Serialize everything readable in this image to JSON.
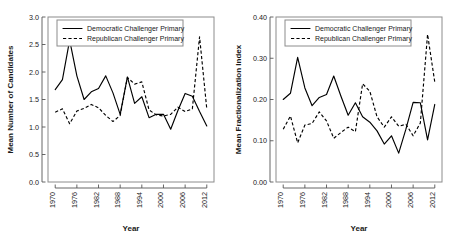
{
  "figure": {
    "panel_count": 2,
    "background": "#ffffff",
    "line_color": "#000000"
  },
  "chart_data": [
    {
      "type": "line",
      "panel": "left",
      "title": "",
      "xlabel": "Year",
      "ylabel": "Mean Number of Candidates",
      "xlim": [
        1968,
        2014
      ],
      "ylim": [
        0.0,
        3.0
      ],
      "xticks": [
        1970,
        1976,
        1982,
        1988,
        1994,
        2000,
        2006,
        2012
      ],
      "xticklabels": [
        "1970",
        "1976",
        "1982",
        "1988",
        "1994",
        "2000",
        "2006",
        "2012"
      ],
      "yticks": [
        0.0,
        0.5,
        1.0,
        1.5,
        2.0,
        2.5,
        3.0
      ],
      "yticklabels": [
        "0.0",
        "0.5",
        "1.0",
        "1.5",
        "2.0",
        "2.5",
        "3.0"
      ],
      "grid": false,
      "legend_position": "top-center",
      "x": [
        1970,
        1972,
        1974,
        1976,
        1978,
        1980,
        1982,
        1984,
        1986,
        1988,
        1990,
        1992,
        1994,
        1996,
        1998,
        2000,
        2002,
        2004,
        2006,
        2008,
        2010,
        2012
      ],
      "series": [
        {
          "name": "Democratic Challenger Primary",
          "style": "solid",
          "values": [
            1.68,
            1.86,
            2.58,
            1.93,
            1.5,
            1.64,
            1.7,
            1.93,
            1.62,
            1.23,
            1.91,
            1.43,
            1.55,
            1.17,
            1.23,
            1.23,
            0.96,
            1.3,
            1.61,
            1.56,
            1.28,
            1.02
          ]
        },
        {
          "name": "Republican Challenger Primary",
          "style": "dashed",
          "values": [
            1.27,
            1.33,
            1.06,
            1.29,
            1.34,
            1.41,
            1.35,
            1.21,
            1.1,
            1.21,
            1.9,
            1.78,
            1.82,
            1.31,
            1.22,
            1.2,
            1.23,
            1.36,
            1.28,
            1.33,
            2.64,
            1.33
          ]
        }
      ]
    },
    {
      "type": "line",
      "panel": "right",
      "title": "",
      "xlabel": "Year",
      "ylabel": "Mean Fractionalization Index",
      "xlim": [
        1968,
        2014
      ],
      "ylim": [
        0.0,
        0.4
      ],
      "xticks": [
        1970,
        1976,
        1982,
        1988,
        1994,
        2000,
        2006,
        2012
      ],
      "xticklabels": [
        "1970",
        "1976",
        "1982",
        "1988",
        "1994",
        "2000",
        "2006",
        "2012"
      ],
      "yticks": [
        0.0,
        0.1,
        0.2,
        0.3,
        0.4
      ],
      "yticklabels": [
        "0.00",
        "0.10",
        "0.20",
        "0.30",
        "0.40"
      ],
      "grid": false,
      "legend_position": "top-center",
      "x": [
        1970,
        1972,
        1974,
        1976,
        1978,
        1980,
        1982,
        1984,
        1986,
        1988,
        1990,
        1992,
        1994,
        1996,
        1998,
        2000,
        2002,
        2004,
        2006,
        2008,
        2010,
        2012
      ],
      "series": [
        {
          "name": "Democratic Challenger Primary",
          "style": "solid",
          "values": [
            0.2,
            0.215,
            0.302,
            0.228,
            0.185,
            0.205,
            0.212,
            0.257,
            0.208,
            0.162,
            0.192,
            0.158,
            0.145,
            0.124,
            0.092,
            0.112,
            0.07,
            0.128,
            0.193,
            0.192,
            0.102,
            0.188
          ]
        },
        {
          "name": "Republican Challenger Primary",
          "style": "dashed",
          "values": [
            0.128,
            0.16,
            0.095,
            0.138,
            0.142,
            0.17,
            0.148,
            0.106,
            0.12,
            0.133,
            0.122,
            0.238,
            0.22,
            0.158,
            0.133,
            0.158,
            0.135,
            0.14,
            0.112,
            0.143,
            0.358,
            0.242
          ]
        }
      ]
    }
  ],
  "legend": {
    "entries": [
      {
        "label": "Democratic Challenger Primary",
        "style": "solid"
      },
      {
        "label": "Republican Challenger Primary",
        "style": "dashed"
      }
    ]
  }
}
